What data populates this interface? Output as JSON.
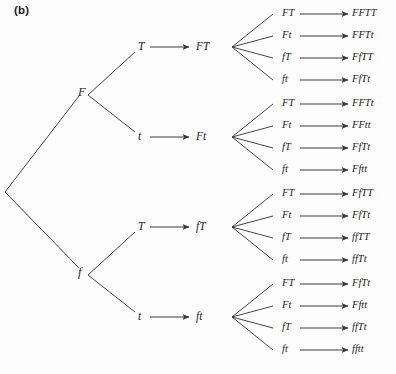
{
  "figure": {
    "panel_label": "(b)",
    "caption": "",
    "background_color": "#fdfdfd",
    "line_color": "#3a3a3a",
    "text_color": "#242424"
  },
  "tree": {
    "root": {
      "x": 5,
      "y": 192
    },
    "level1": [
      {
        "label": "F",
        "x": 78,
        "y": 92,
        "vx": 88,
        "vy": 95
      },
      {
        "label": "f",
        "x": 78,
        "y": 272,
        "vx": 88,
        "vy": 275
      }
    ],
    "level2": [
      {
        "label": "T",
        "x": 138,
        "y": 47,
        "parent": 0
      },
      {
        "label": "t",
        "x": 138,
        "y": 137,
        "parent": 0
      },
      {
        "label": "T",
        "x": 138,
        "y": 227,
        "parent": 1
      },
      {
        "label": "t",
        "x": 138,
        "y": 317,
        "parent": 1
      }
    ],
    "level3": [
      {
        "label": "FT",
        "x": 196,
        "y": 47,
        "vx": 232,
        "vy": 47
      },
      {
        "label": "Ft",
        "x": 196,
        "y": 137,
        "vx": 232,
        "vy": 137
      },
      {
        "label": "fT",
        "x": 196,
        "y": 227,
        "vx": 232,
        "vy": 227
      },
      {
        "label": "ft",
        "x": 196,
        "y": 317,
        "vx": 232,
        "vy": 317
      }
    ],
    "groups": [
      {
        "parent_gamete": "FT",
        "rows": [
          {
            "gamete": "FT",
            "zygote": "FFTT",
            "y": 14
          },
          {
            "gamete": "Ft",
            "zygote": "FFTt",
            "y": 36
          },
          {
            "gamete": "fT",
            "zygote": "FfTT",
            "y": 58
          },
          {
            "gamete": "ft",
            "zygote": "FfTt",
            "y": 80
          }
        ]
      },
      {
        "parent_gamete": "Ft",
        "rows": [
          {
            "gamete": "FT",
            "zygote": "FFTt",
            "y": 104
          },
          {
            "gamete": "Ft",
            "zygote": "FFtt",
            "y": 126
          },
          {
            "gamete": "fT",
            "zygote": "FfTt",
            "y": 148
          },
          {
            "gamete": "ft",
            "zygote": "Fftt",
            "y": 170
          }
        ]
      },
      {
        "parent_gamete": "fT",
        "rows": [
          {
            "gamete": "FT",
            "zygote": "FfTT",
            "y": 194
          },
          {
            "gamete": "Ft",
            "zygote": "FfTt",
            "y": 216
          },
          {
            "gamete": "fT",
            "zygote": "ffTT",
            "y": 238
          },
          {
            "gamete": "ft",
            "zygote": "ffTt",
            "y": 260
          }
        ]
      },
      {
        "parent_gamete": "ft",
        "rows": [
          {
            "gamete": "FT",
            "zygote": "FfTt",
            "y": 284
          },
          {
            "gamete": "Ft",
            "zygote": "Fftt",
            "y": 306
          },
          {
            "gamete": "fT",
            "zygote": "ffTt",
            "y": 328
          },
          {
            "gamete": "ft",
            "zygote": "fftt",
            "y": 350
          }
        ]
      }
    ],
    "geometry": {
      "gamete_x": 282,
      "arrow_start_x": 300,
      "arrow_end_x": 348,
      "zygote_x": 352
    }
  }
}
